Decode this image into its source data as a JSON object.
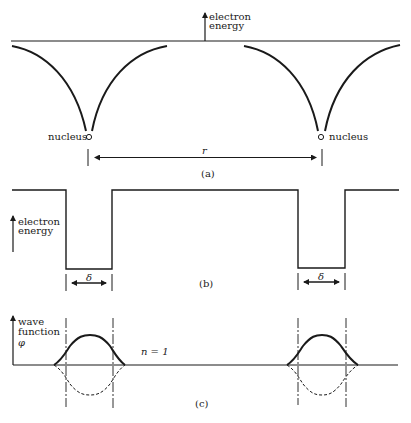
{
  "colors": {
    "ink": "#1a1a1a",
    "background": "#ffffff"
  },
  "panel_a": {
    "axis_label_line1": "electron",
    "axis_label_line2": "energy",
    "nucleus_left_label": "nucleus",
    "nucleus_right_label": "nucleus",
    "distance_label": "r",
    "caption": "(a)"
  },
  "panel_b": {
    "axis_label_line1": "electron",
    "axis_label_line2": "energy",
    "well_width_left": "δ",
    "well_width_right": "δ",
    "caption": "(b)"
  },
  "panel_c": {
    "axis_label_line1": "wave",
    "axis_label_line2": "function",
    "axis_symbol": "φ",
    "state_label": "n = 1",
    "caption": "(c)"
  }
}
